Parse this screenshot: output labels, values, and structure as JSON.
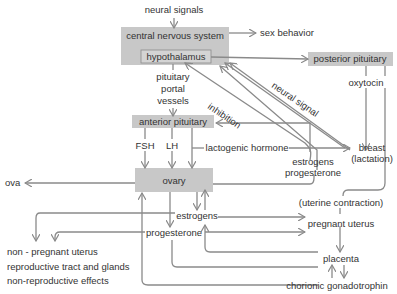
{
  "diagram": {
    "colors": {
      "box_fill": "#c8c8c8",
      "line": "#8a8a8a",
      "text": "#333333",
      "background": "#ffffff"
    },
    "nodes": {
      "neural_signals": "neural signals",
      "cns": "central nervous system",
      "hypothalamus": "hypothalamus",
      "sex_behavior": "sex behavior",
      "posterior_pituitary": "posterior pituitary",
      "oxytocin": "oxytocin",
      "pituitary_portal_1": "pituitary",
      "pituitary_portal_2": "portal",
      "pituitary_portal_3": "vessels",
      "inhibition": "inhibition",
      "neural_signal": "neural signal",
      "anterior_pituitary": "anterior pituitary",
      "fsh": "FSH",
      "lh": "LH",
      "lactogenic_hormone": "lactogenic hormone",
      "breast_1": "breast",
      "breast_2": "(lactation)",
      "estrogens_progesterone_1": "estrogens",
      "estrogens_progesterone_2": "progesterone",
      "ovary": "ovary",
      "ova": "ova",
      "uterine_contraction": "(uterine contraction)",
      "estrogens": "estrogens",
      "pregnant_uterus": "pregnant uterus",
      "progesterone": "progesterone",
      "placenta": "placenta",
      "chorionic_gonadotrophin": "chorionic gonadotrophin",
      "nonpregnant_uterus": "non - pregnant uterus",
      "repro_tract": "reproductive tract and glands",
      "non_repro": "non-reproductive effects"
    }
  }
}
